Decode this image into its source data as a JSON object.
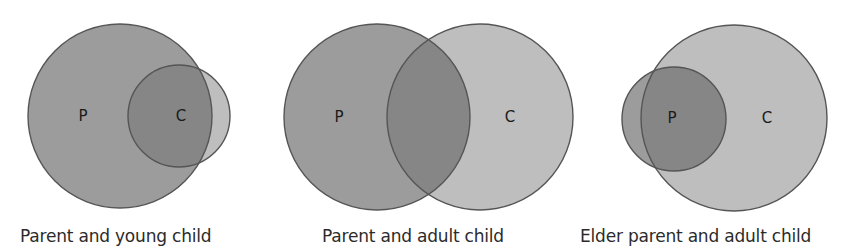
{
  "colors": {
    "parent_fill": "#9c9c9c",
    "child_fill": "#bebebe",
    "overlap_fill": "#868686",
    "stroke": "#555555",
    "background": "#ffffff"
  },
  "diagrams": [
    {
      "caption": "Parent and young child",
      "parent": {
        "label": "P",
        "cx": 120,
        "cy": 116,
        "r": 92
      },
      "child": {
        "label": "C",
        "cx": 179,
        "cy": 116,
        "r": 51
      },
      "label_pos": {
        "P": [
          83,
          121
        ],
        "C": [
          181,
          121
        ]
      }
    },
    {
      "caption": "Parent and adult child",
      "parent": {
        "label": "P",
        "cx": 377,
        "cy": 117,
        "r": 93
      },
      "child": {
        "label": "C",
        "cx": 480,
        "cy": 117,
        "r": 93
      },
      "label_pos": {
        "P": [
          339,
          122
        ],
        "C": [
          510,
          122
        ]
      }
    },
    {
      "caption": "Elder parent and adult child",
      "parent": {
        "label": "P",
        "cx": 674,
        "cy": 119,
        "r": 52
      },
      "child": {
        "label": "C",
        "cx": 734,
        "cy": 118,
        "r": 93
      },
      "label_pos": {
        "P": [
          672,
          123
        ],
        "C": [
          767,
          123
        ]
      }
    }
  ]
}
